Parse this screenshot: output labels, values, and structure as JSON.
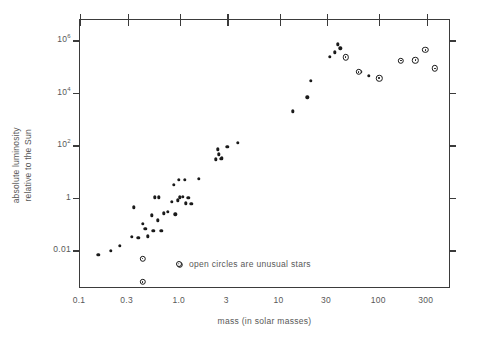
{
  "chart_data": {
    "type": "scatter",
    "title": "",
    "xlabel": "mass (in solar masses)",
    "ylabel": "absolute luminosity\nrelative to the Sun",
    "ylabel_line1": "absolute luminosity",
    "ylabel_line2": "relative to the Sun",
    "xscale": "log",
    "yscale": "log",
    "xlim": [
      0.1,
      500
    ],
    "ylim": [
      0.0004,
      6000000
    ],
    "grid": false,
    "legend_position": "inside-bottom-center",
    "annotations": [
      {
        "text": "open circles are unusual stars",
        "marker": "open-circle",
        "x": 1.0,
        "y": 0.0028
      }
    ],
    "xticks": [
      {
        "value": 0.1,
        "label": "0.1"
      },
      {
        "value": 0.3,
        "label": "0.3"
      },
      {
        "value": 1.0,
        "label": "1.0"
      },
      {
        "value": 3,
        "label": "3"
      },
      {
        "value": 10,
        "label": "10"
      },
      {
        "value": 30,
        "label": "30"
      },
      {
        "value": 100,
        "label": "100"
      },
      {
        "value": 300,
        "label": "300"
      }
    ],
    "yticks": [
      {
        "value": 1000000,
        "label": "10",
        "exponent": "6"
      },
      {
        "value": 10000,
        "label": "10",
        "exponent": "4"
      },
      {
        "value": 100,
        "label": "10",
        "exponent": "2"
      },
      {
        "value": 1,
        "label": "1",
        "exponent": ""
      },
      {
        "value": 0.01,
        "label": "0.01",
        "exponent": ""
      }
    ],
    "series": [
      {
        "name": "main sequence stars",
        "marker": "filled-dot",
        "color": "#1a1a1a",
        "points": [
          [
            0.152,
            0.0068
          ],
          [
            0.205,
            0.0095
          ],
          [
            0.25,
            0.0145
          ],
          [
            0.33,
            0.032
          ],
          [
            0.345,
            0.43
          ],
          [
            0.385,
            0.03
          ],
          [
            0.425,
            0.105
          ],
          [
            0.45,
            0.065
          ],
          [
            0.475,
            0.034
          ],
          [
            0.525,
            0.215
          ],
          [
            0.545,
            0.055
          ],
          [
            0.56,
            1.05
          ],
          [
            0.6,
            0.14
          ],
          [
            0.62,
            1.05
          ],
          [
            0.655,
            0.056
          ],
          [
            0.69,
            0.255
          ],
          [
            0.76,
            0.295
          ],
          [
            0.83,
            0.72
          ],
          [
            0.87,
            3.2
          ],
          [
            0.905,
            0.235
          ],
          [
            0.95,
            0.8
          ],
          [
            0.985,
            5.0
          ],
          [
            1.0,
            1.05
          ],
          [
            1.08,
            1.1
          ],
          [
            1.12,
            4.9
          ],
          [
            1.15,
            0.62
          ],
          [
            1.22,
            1.0
          ],
          [
            1.3,
            0.6
          ],
          [
            1.55,
            5.4
          ],
          [
            2.3,
            29
          ],
          [
            2.4,
            72
          ],
          [
            2.45,
            46
          ],
          [
            2.6,
            31
          ],
          [
            2.65,
            33
          ],
          [
            3.0,
            88
          ],
          [
            3.8,
            128
          ],
          [
            13.5,
            2000
          ],
          [
            19.0,
            6800
          ],
          [
            20.5,
            29000
          ],
          [
            32.0,
            240000
          ],
          [
            36.0,
            350000
          ],
          [
            38.5,
            700000
          ],
          [
            40.5,
            500000
          ],
          [
            65.0,
            64000
          ],
          [
            78.0,
            45000
          ]
        ]
      },
      {
        "name": "unusual stars",
        "marker": "open-circle",
        "color": "#1a1a1a",
        "points": [
          [
            0.425,
            0.0048
          ],
          [
            0.425,
            0.00062
          ],
          [
            1.0,
            0.0028
          ],
          [
            46.0,
            230000
          ],
          [
            62.0,
            62000
          ],
          [
            100.0,
            36000
          ],
          [
            165.0,
            170000
          ],
          [
            230.0,
            175000
          ],
          [
            290.0,
            430000
          ],
          [
            360.0,
            86000
          ]
        ]
      }
    ]
  }
}
